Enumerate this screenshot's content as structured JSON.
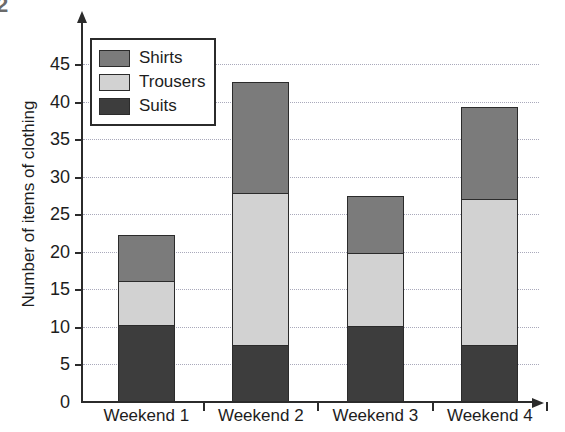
{
  "figure_number": "2",
  "chart_data": {
    "type": "bar",
    "subtype": "stacked-bar",
    "title": "",
    "xlabel": "",
    "ylabel": "Number of items of clothing",
    "categories": [
      "Weekend 1",
      "Weekend 2",
      "Weekend 3",
      "Weekend 4"
    ],
    "series": [
      {
        "name": "Suits",
        "color": "#3d3d3d",
        "values": [
          10,
          7.3,
          9.8,
          7.3
        ]
      },
      {
        "name": "Trousers",
        "color": "#d2d2d2",
        "values": [
          5.8,
          20.2,
          9.8,
          19.5
        ]
      },
      {
        "name": "Shirts",
        "color": "#7b7b7b",
        "values": [
          6.2,
          14.8,
          7.6,
          12.2
        ]
      }
    ],
    "totals": [
      22,
      42.3,
      27.2,
      39
    ],
    "ylim": [
      0,
      47
    ],
    "yticks": [
      0,
      5,
      10,
      15,
      20,
      25,
      30,
      35,
      40,
      45
    ],
    "ytick_labels": [
      "0",
      "5",
      "10",
      "15",
      "20",
      "25",
      "30",
      "35",
      "40",
      "45"
    ],
    "grid": true,
    "grid_axis": "y",
    "legend_position": "top-left-inside",
    "legend_entries": [
      "Shirts",
      "Trousers",
      "Suits"
    ],
    "axis_color": "#2b2b2b",
    "grid_color": "#a9a9bb",
    "background": "#ffffff"
  }
}
